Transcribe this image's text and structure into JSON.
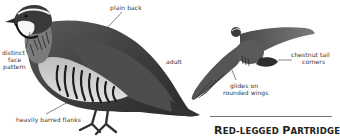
{
  "illustration": {
    "subject": "Red-legged Partridge",
    "labels": {
      "plain_back": "plain back",
      "face_pattern_line1": "distinct",
      "face_pattern_line2": "face",
      "face_pattern_line3": "pattern",
      "adult": "adult",
      "tail_line1": "chestnut tail",
      "tail_line2": "corners",
      "glides_line1": "glides on",
      "glides_line2": "rounded wings",
      "flanks": "heavily barred flanks"
    },
    "title": {
      "first_cap": "R",
      "first_rest": "ED-LEGGED ",
      "second_cap": "P",
      "second_rest": "ARTRIDGE"
    }
  }
}
